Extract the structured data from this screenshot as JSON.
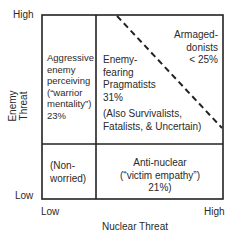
{
  "axes": {
    "y_title": "Enemy Threat",
    "y_high": "High",
    "y_low": "Low",
    "x_title": "Nuclear Threat",
    "x_low": "Low",
    "x_high": "High"
  },
  "quadrants": {
    "top_left": {
      "lines": [
        "Aggressive",
        "enemy",
        "perceiving",
        "(“warrior",
        "mentality”)",
        "23%"
      ]
    },
    "top_right_main": {
      "lines": [
        "Enemy-",
        "fearing",
        "Pragmatists",
        "31%"
      ]
    },
    "top_right_note": {
      "lines": [
        "(Also Survivalists,",
        "Fatalists, & Uncertain)"
      ]
    },
    "top_right_corner": {
      "lines": [
        "Armaged-",
        "donists",
        "< 25%"
      ]
    },
    "bottom_left": {
      "lines": [
        "(Non-",
        "worried)"
      ]
    },
    "bottom_right": {
      "lines": [
        "Anti-nuclear",
        "(“victim empathy”)",
        "21%)"
      ]
    }
  },
  "colors": {
    "line": "#222222",
    "text": "#2a2a2a"
  }
}
